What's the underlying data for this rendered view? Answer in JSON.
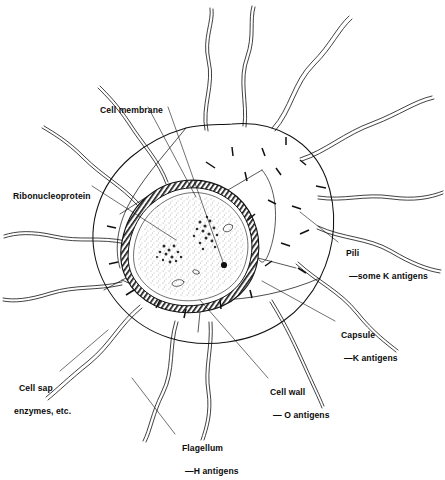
{
  "diagram": {
    "type": "biological-line-drawing",
    "background_color": "#ffffff",
    "ink_color": "#111111"
  },
  "labels": {
    "cell_membrane": {
      "text": "Cell membrane",
      "x": 95,
      "y": 93
    },
    "ribonucleoprotein": {
      "text": "Ribonucleoprotein",
      "x": 8,
      "y": 179
    },
    "pili": {
      "main": "Pili",
      "sub": "—some K antigens",
      "x": 341,
      "y": 236
    },
    "capsule": {
      "main": "Capsule",
      "sub": "—K antigens",
      "x": 336,
      "y": 318
    },
    "cell_wall": {
      "main": "Cell wall",
      "sub": "— O antigens",
      "x": 265,
      "y": 375
    },
    "cell_sap": {
      "main": "Cell sap",
      "sub": "enzymes, etc.",
      "x": 14,
      "y": 371
    },
    "flagellum": {
      "main": "Flagellum",
      "sub": "—H antigens",
      "x": 177,
      "y": 431
    }
  },
  "structures": {
    "capsule_outline": "large irregular rounded outer envelope",
    "cell_wall_layer": "hatched dark band",
    "cell_membrane_layer": "thin inner line",
    "cytoplasm": "stippled interior",
    "nucleoid_clusters": 2,
    "vacuoles": 3,
    "flagella_count": 14,
    "pili_count": 22
  }
}
